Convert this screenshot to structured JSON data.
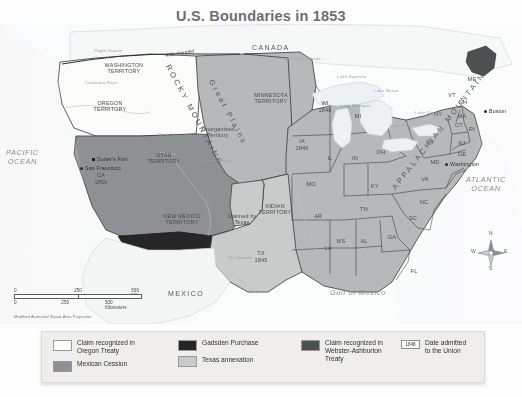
{
  "title": "U.S. Boundaries in 1853",
  "colors": {
    "oregon_treaty": "#fbfbfa",
    "mexican_cession": "#8e9194",
    "gadsden_purchase": "#262626",
    "texas_annexation": "#c9cbcb",
    "webster_ashburton": "#4d4f51",
    "states_fill": "#b6b9ba",
    "water": "#eef1f3",
    "background": "#fdfdfd",
    "title_color": "#6f6f6f"
  },
  "countries": [
    {
      "name": "CANADA",
      "x": 252,
      "y": 44
    },
    {
      "name": "MEXICO",
      "x": 168,
      "y": 290
    }
  ],
  "oceans": [
    {
      "name": "PACIFIC\nOCEAN",
      "line1": "PACIFIC",
      "line2": "OCEAN",
      "x": 6,
      "y": 148
    },
    {
      "name": "ATLANTIC\nOCEAN",
      "line1": "ATLANTIC",
      "line2": "OCEAN",
      "x": 466,
      "y": 175
    },
    {
      "name": "Gulf of Mexico",
      "line1": "Gulf of Mexico",
      "line2": "",
      "x": 330,
      "y": 288
    }
  ],
  "territories": [
    {
      "line1": "WASHINGTON",
      "line2": "TERRITORY",
      "x": 124,
      "y": 62
    },
    {
      "line1": "OREGON",
      "line2": "TERRITORY",
      "x": 110,
      "y": 100
    },
    {
      "line1": "UTAH",
      "line2": "TERRITORY",
      "x": 164,
      "y": 152
    },
    {
      "line1": "NEW MEXICO",
      "line2": "TERRITORY",
      "x": 182,
      "y": 213
    },
    {
      "line1": "MINNESOTA",
      "line2": "TERRITORY",
      "x": 271,
      "y": 92
    },
    {
      "line1": "INDIAN",
      "line2": "TERRITORY",
      "x": 275,
      "y": 203
    },
    {
      "line1": "Unorganized",
      "line2": "Territory",
      "x": 218,
      "y": 126
    },
    {
      "line1": "Claimed by",
      "line2": "Texas",
      "x": 242,
      "y": 213
    }
  ],
  "states": [
    {
      "abbr": "CA",
      "year": "1850",
      "x": 101,
      "y": 172
    },
    {
      "abbr": "TX",
      "year": "1845",
      "x": 261,
      "y": 250
    },
    {
      "abbr": "WI",
      "year": "1848",
      "x": 325,
      "y": 100
    },
    {
      "abbr": "IA",
      "year": "1846",
      "x": 302,
      "y": 138
    },
    {
      "abbr": "MI",
      "year": "",
      "x": 358,
      "y": 113
    },
    {
      "abbr": "IL",
      "year": "",
      "x": 330,
      "y": 155
    },
    {
      "abbr": "IN",
      "year": "",
      "x": 355,
      "y": 155
    },
    {
      "abbr": "OH",
      "year": "",
      "x": 381,
      "y": 149
    },
    {
      "abbr": "MO",
      "year": "",
      "x": 311,
      "y": 181
    },
    {
      "abbr": "KY",
      "year": "",
      "x": 375,
      "y": 183
    },
    {
      "abbr": "TN",
      "year": "",
      "x": 364,
      "y": 206
    },
    {
      "abbr": "AR",
      "year": "",
      "x": 318,
      "y": 213
    },
    {
      "abbr": "LA",
      "year": "",
      "x": 328,
      "y": 245
    },
    {
      "abbr": "MS",
      "year": "",
      "x": 341,
      "y": 238
    },
    {
      "abbr": "AL",
      "year": "",
      "x": 364,
      "y": 238
    },
    {
      "abbr": "GA",
      "year": "",
      "x": 392,
      "y": 234
    },
    {
      "abbr": "FL",
      "year": "",
      "x": 414,
      "y": 268
    },
    {
      "abbr": "SC",
      "year": "",
      "x": 413,
      "y": 215
    },
    {
      "abbr": "NC",
      "year": "",
      "x": 424,
      "y": 199
    },
    {
      "abbr": "VA",
      "year": "",
      "x": 425,
      "y": 176
    },
    {
      "abbr": "MD",
      "year": "",
      "x": 435,
      "y": 159
    },
    {
      "abbr": "DE",
      "year": "",
      "x": 462,
      "y": 151
    },
    {
      "abbr": "NJ",
      "year": "",
      "x": 462,
      "y": 140
    },
    {
      "abbr": "PA",
      "year": "",
      "x": 430,
      "y": 139
    },
    {
      "abbr": "NY",
      "year": "",
      "x": 438,
      "y": 111
    },
    {
      "abbr": "VT",
      "year": "",
      "x": 452,
      "y": 92
    },
    {
      "abbr": "NH",
      "year": "",
      "x": 463,
      "y": 99
    },
    {
      "abbr": "MA",
      "year": "",
      "x": 462,
      "y": 113
    },
    {
      "abbr": "CT",
      "year": "",
      "x": 459,
      "y": 122
    },
    {
      "abbr": "RI",
      "year": "",
      "x": 472,
      "y": 126
    },
    {
      "abbr": "ME",
      "year": "",
      "x": 472,
      "y": 76
    }
  ],
  "cities": [
    {
      "name": "Sutter's Fort",
      "x": 92,
      "y": 158,
      "marker": "square"
    },
    {
      "name": "San Francisco",
      "x": 80,
      "y": 167,
      "marker": "dot"
    },
    {
      "name": "Boston",
      "x": 484,
      "y": 110,
      "marker": "dot"
    },
    {
      "name": "Washington",
      "x": 445,
      "y": 163,
      "marker": "dot"
    }
  ],
  "physical": [
    {
      "name": "ROCKY MOUNTAINS",
      "x": 172,
      "y": 63,
      "rotate": 62
    },
    {
      "name": "Great Plains",
      "x": 215,
      "y": 78,
      "rotate": 62
    },
    {
      "name": "APPALACHIAN MOUNTAINS",
      "x": 390,
      "y": 186,
      "rotate": -52
    }
  ],
  "water_features": [
    {
      "name": "Puget Sound",
      "x": 94,
      "y": 48
    },
    {
      "name": "Columbia River",
      "x": 85,
      "y": 80
    },
    {
      "name": "Great Salt Lake",
      "x": 158,
      "y": 132
    },
    {
      "name": "Colorado River",
      "x": 200,
      "y": 158
    },
    {
      "name": "Lake of the Woods",
      "x": 281,
      "y": 56
    },
    {
      "name": "Lake Superior",
      "x": 337,
      "y": 74
    },
    {
      "name": "Lake Michigan",
      "x": 340,
      "y": 103
    },
    {
      "name": "Lake Huron",
      "x": 374,
      "y": 88
    },
    {
      "name": "Lake Erie",
      "x": 390,
      "y": 123
    },
    {
      "name": "Lake Ontario",
      "x": 415,
      "y": 110
    },
    {
      "name": "Rio Grande",
      "x": 228,
      "y": 255
    }
  ],
  "boundaries": [
    {
      "name": "49th Parallel",
      "x": 165,
      "y": 53,
      "rotate": -9
    }
  ],
  "scale": {
    "miles": {
      "zero": "0",
      "mid": "250",
      "max": "500 Miles"
    },
    "kilometers": {
      "zero": "0",
      "mid": "250",
      "max": "500 Kilometers"
    },
    "projection": "Modified Azimuthal Equal-Area Projection"
  },
  "legend": {
    "items": [
      {
        "label_line1": "Claim recognized in",
        "label_line2": "Oregon Treaty",
        "swatch": "#fbfbfa",
        "type": "swatch"
      },
      {
        "label_line1": "Mexican Cession",
        "label_line2": "",
        "swatch": "#8e9194",
        "type": "swatch"
      },
      {
        "label_line1": "Gadsden Purchase",
        "label_line2": "",
        "swatch": "#262626",
        "type": "swatch"
      },
      {
        "label_line1": "Texas annexation",
        "label_line2": "",
        "swatch": "#c9cbcb",
        "type": "swatch"
      },
      {
        "label_line1": "Claim recognized in",
        "label_line2": "Webster-Ashburton",
        "label_line3": "Treaty",
        "swatch": "#4d4f51",
        "type": "swatch"
      },
      {
        "label_line1": "Date admitted",
        "label_line2": "to the Union",
        "badge": "1848",
        "type": "badge"
      }
    ]
  },
  "compass": {
    "north": "N",
    "south": "S",
    "east": "E",
    "west": "W"
  }
}
